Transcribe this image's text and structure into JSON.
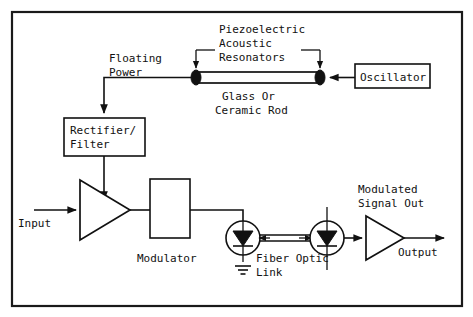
{
  "figure": {
    "kind": "block-diagram",
    "title_in_image": "",
    "border_color": "#1a1a1a",
    "line_color": "#111111",
    "background": "#ffffff"
  },
  "labels": {
    "piezoelectric_resonators": {
      "line1": "Piezoelectric",
      "line2": "Acoustic",
      "line3": "Resonators"
    },
    "floating_power": {
      "line1": "Floating",
      "line2": "Power"
    },
    "rod": {
      "line1": "Glass Or",
      "line2": "Ceramic Rod"
    },
    "oscillator": "Oscillator",
    "rectifier_filter": {
      "line1": "Rectifier/",
      "line2": "Filter"
    },
    "input": "Input",
    "modulator": "Modulator",
    "fiber_optic_link": {
      "line1": "Fiber Optic",
      "line2": "Link"
    },
    "modulated_signal_out": {
      "line1": "Modulated",
      "line2": "Signal Out"
    },
    "output": "Output"
  },
  "blocks": [
    {
      "id": "oscillator",
      "label": "Oscillator",
      "shape": "rect"
    },
    {
      "id": "rectifier-filter",
      "label": "Rectifier/ Filter",
      "shape": "rect"
    },
    {
      "id": "modulator",
      "label": "Modulator",
      "shape": "rect"
    },
    {
      "id": "amplifier-input",
      "label": "",
      "shape": "triangle"
    },
    {
      "id": "amplifier-output",
      "label": "",
      "shape": "triangle"
    },
    {
      "id": "led-transmitter",
      "label": "",
      "shape": "circle-diode"
    },
    {
      "id": "photodiode-receiver",
      "label": "",
      "shape": "circle-diode"
    },
    {
      "id": "acoustic-rod",
      "label": "Glass Or Ceramic Rod",
      "shape": "rod"
    }
  ],
  "signals": [
    {
      "id": "input-signal",
      "label": "Input"
    },
    {
      "id": "output-signal",
      "label": "Output"
    },
    {
      "id": "floating-power-line",
      "label": "Floating Power"
    },
    {
      "id": "fiber-link",
      "label": "Fiber Optic Link"
    }
  ]
}
